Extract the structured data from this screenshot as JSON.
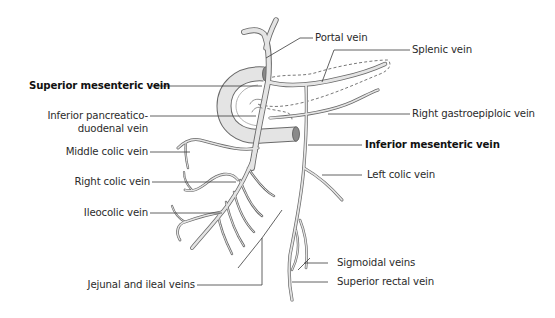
{
  "figure": {
    "colors": {
      "background": "#ffffff",
      "vessel_fill": "#e4e4e4",
      "vessel_stroke": "#6a6a6a",
      "leader_line": "#3a3a3a",
      "text": "#2b2b2b"
    }
  },
  "labels": {
    "portal_vein": "Portal vein",
    "splenic_vein": "Splenic vein",
    "superior_mesenteric_vein": "Superior mesenteric vein",
    "inferior_pancreaticoduodenal_vein_line1": "Inferior pancreatico-",
    "inferior_pancreaticoduodenal_vein_line2": "duodenal vein",
    "right_gastroepiploic_vein": "Right gastroepiploic vein",
    "inferior_mesenteric_vein": "Inferior mesenteric vein",
    "middle_colic_vein": "Middle colic vein",
    "left_colic_vein": "Left colic vein",
    "right_colic_vein": "Right colic vein",
    "ileocolic_vein": "Ileocolic vein",
    "sigmoidal_veins": "Sigmoidal veins",
    "superior_rectal_vein": "Superior rectal vein",
    "jejunal_and_ileal_veins": "Jejunal and ileal veins"
  }
}
